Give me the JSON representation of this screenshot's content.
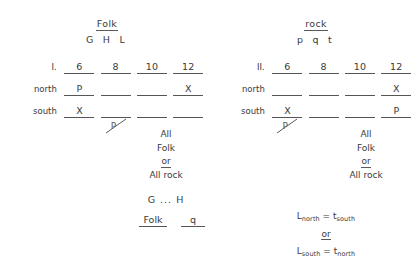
{
  "document": {
    "background_color": "#ffffff",
    "ink_color": "#3a3a3a"
  },
  "left_panel": {
    "heading": {
      "genre": "Folk",
      "letters": "G H L"
    },
    "table": {
      "number_row_label": "I.",
      "columns": [
        "6",
        "8",
        "10",
        "12"
      ],
      "rows": [
        {
          "label": "north",
          "values": [
            "P",
            "",
            "",
            "X"
          ]
        },
        {
          "label": "south",
          "values": [
            "X",
            "",
            "",
            ""
          ]
        }
      ],
      "strike_mark": {
        "column_index": 1,
        "glyph": "P"
      }
    },
    "note": {
      "line1": "All",
      "line2": "Folk",
      "line3": "or",
      "line4": "All rock"
    },
    "gh_line": "G ... H",
    "bottom_pair": {
      "left": "Folk",
      "right": "q"
    }
  },
  "right_panel": {
    "heading": {
      "genre": "rock",
      "letters": "p q t"
    },
    "table": {
      "number_row_label": "II.",
      "columns": [
        "6",
        "8",
        "10",
        "12"
      ],
      "rows": [
        {
          "label": "north",
          "values": [
            "",
            "",
            "",
            "X"
          ]
        },
        {
          "label": "south",
          "values": [
            "X",
            "",
            "",
            "P"
          ]
        }
      ],
      "strike_mark": {
        "column_index": 0,
        "glyph": "P"
      }
    },
    "note": {
      "line1": "All",
      "line2": "Folk",
      "line3": "or",
      "line4": "All rock"
    },
    "equations": {
      "eq1_base_a": "L",
      "eq1_sub_a": "north",
      "eq1_rel": " = ",
      "eq1_base_b": "t",
      "eq1_sub_b": "south",
      "connector": "or",
      "eq2_base_a": "L",
      "eq2_sub_a": "south",
      "eq2_rel": " = ",
      "eq2_base_b": "t",
      "eq2_sub_b": "north"
    }
  }
}
